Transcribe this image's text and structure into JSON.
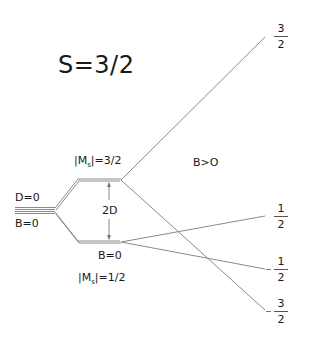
{
  "diagram": {
    "title": "S=3/2",
    "labels": {
      "d_zero": "D=0",
      "b_zero_left": "B=0",
      "ms_upper": {
        "prefix": "|M",
        "sub": "s",
        "suffix": "|=3/2"
      },
      "ms_lower": {
        "prefix": "|M",
        "sub": "s",
        "suffix": "|=1/2"
      },
      "b_zero_mid": "B=0",
      "splitting": "2D",
      "field_on": "B>O"
    },
    "levels": [
      {
        "sign": "+",
        "num": "3",
        "den": "2"
      },
      {
        "sign": "+",
        "num": "1",
        "den": "2"
      },
      {
        "sign": "-",
        "num": "1",
        "den": "2"
      },
      {
        "sign": "-",
        "num": "3",
        "den": "2"
      }
    ],
    "colors": {
      "line": "#8a8a8a",
      "text": "#1a1a1a",
      "background": "#ffffff"
    }
  }
}
